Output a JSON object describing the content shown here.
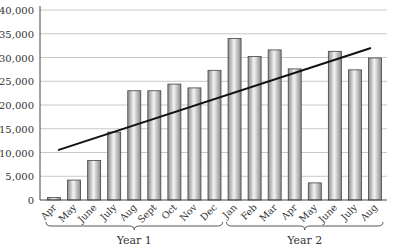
{
  "chart_data": {
    "type": "bar",
    "title": "",
    "xlabel": "",
    "ylabel": "",
    "ylim": [
      0,
      40000
    ],
    "yticks": [
      0,
      5000,
      10000,
      15000,
      20000,
      25000,
      30000,
      35000,
      40000
    ],
    "ytick_labels": [
      "0",
      "5,000",
      "10,000",
      "15,000",
      "20,000",
      "25,000",
      "30,000",
      "35,000",
      "40,000"
    ],
    "grid": true,
    "legend": null,
    "categories": [
      "Apr",
      "May",
      "June",
      "July",
      "Aug",
      "Sept",
      "Oct",
      "Nov",
      "Dec",
      "Jan",
      "Feb",
      "Mar",
      "Apr",
      "May",
      "June",
      "July",
      "Aug"
    ],
    "values": [
      500,
      4200,
      8300,
      14300,
      23000,
      23000,
      24400,
      23600,
      27300,
      34000,
      30200,
      31600,
      27600,
      3600,
      31300,
      27400,
      29900
    ],
    "trendline": {
      "type": "linear",
      "start": 10500,
      "end": 32000
    },
    "groups": [
      {
        "label": "Year 1",
        "from": 0,
        "to": 8
      },
      {
        "label": "Year 2",
        "from": 9,
        "to": 16
      }
    ]
  },
  "colors": {
    "bar_light": "#f2f2f2",
    "bar_dark": "#8a8a8a",
    "bar_stroke": "#444444",
    "grid": "#c8c8c8",
    "trend": "#111111"
  }
}
